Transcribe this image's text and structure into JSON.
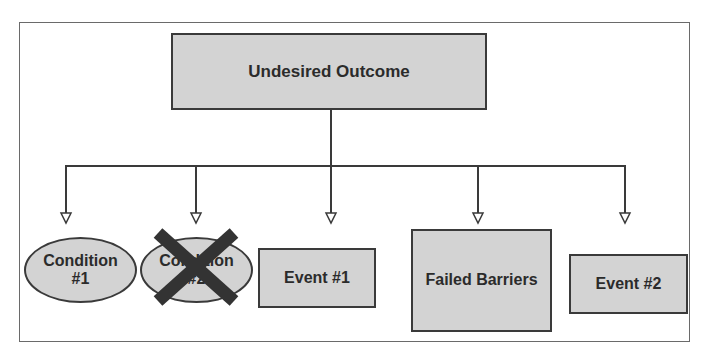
{
  "diagram": {
    "type": "fault-tree",
    "top_event": {
      "label": "Undesired Outcome"
    },
    "children": [
      {
        "id": "condition-1",
        "shape": "ellipse",
        "line1": "Condition",
        "line2": "#1",
        "crossed_out": false
      },
      {
        "id": "condition-2",
        "shape": "ellipse",
        "line1": "Condition",
        "line2": "#2",
        "crossed_out": true
      },
      {
        "id": "event-1",
        "shape": "rectangle",
        "label": "Event #1",
        "crossed_out": false
      },
      {
        "id": "failed-barriers",
        "shape": "rectangle",
        "label": "Failed Barriers",
        "crossed_out": false
      },
      {
        "id": "event-2",
        "shape": "rectangle",
        "label": "Event #2",
        "crossed_out": false
      }
    ],
    "colors": {
      "node_fill": "#d3d3d3",
      "node_border": "#3a3a3a",
      "text": "#2b2b2b",
      "connector": "#3a3a3a",
      "cross_mark": "#333333",
      "frame": "#6a6a6a",
      "background": "#ffffff"
    }
  }
}
